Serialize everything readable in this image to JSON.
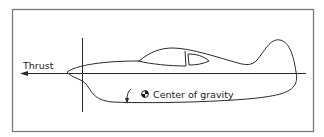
{
  "diagram": {
    "thrust_label": "Thrust",
    "cg_label": "Center of gravity",
    "icons": [
      "thrust-arrow-icon",
      "pitch-rotation-arrow-icon",
      "center-of-gravity-icon"
    ],
    "line_color": "#2a2a2a",
    "frame_color": "#7a7a7a"
  }
}
